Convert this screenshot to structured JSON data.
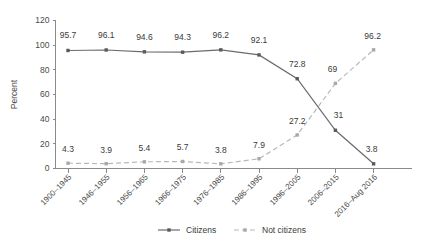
{
  "chart_data": {
    "type": "line",
    "title": "",
    "xlabel": "",
    "ylabel": "Percent",
    "ylim": [
      0,
      120
    ],
    "ytick_step": 20,
    "yticks": [
      "0",
      "20",
      "40",
      "60",
      "80",
      "100",
      "120"
    ],
    "grid": false,
    "legend_position": "bottom",
    "categories": [
      "1900–1945",
      "1946–1955",
      "1956–1965",
      "1966–1975",
      "1976–1985",
      "1986–1995",
      "1996–2005",
      "2006–2015",
      "2016–Aug 2016"
    ],
    "series": [
      {
        "name": "Citizens",
        "color": "#6b6b6b",
        "style": "solid",
        "values": [
          95.7,
          96.1,
          94.6,
          94.3,
          96.2,
          92.1,
          72.8,
          31,
          3.8
        ],
        "labels": [
          "95.7",
          "96.1",
          "94.6",
          "94.3",
          "96.2",
          "92.1",
          "72.8",
          "31",
          "3.8"
        ]
      },
      {
        "name": "Not citizens",
        "color": "#b9b9b9",
        "style": "dashed",
        "values": [
          4.3,
          3.9,
          5.4,
          5.7,
          3.8,
          7.9,
          27.2,
          69,
          96.2
        ],
        "labels": [
          "4.3",
          "3.9",
          "5.4",
          "5.7",
          "3.8",
          "7.9",
          "27.2",
          "69",
          "96.2"
        ]
      }
    ]
  },
  "legend": {
    "items": [
      {
        "label": "Citizens"
      },
      {
        "label": "Not citizens"
      }
    ]
  }
}
